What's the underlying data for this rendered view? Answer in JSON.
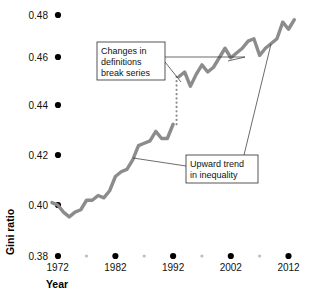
{
  "chart_data": {
    "type": "line",
    "title": "",
    "xlabel": "Year",
    "ylabel": "Gini ratio",
    "xlim": [
      1967,
      2014
    ],
    "ylim": [
      0.38,
      0.485
    ],
    "grid": false,
    "legend": "none",
    "y_ticks": [
      "0.48",
      "0.46",
      "0.44",
      "0.42",
      "0.40",
      "0.38"
    ],
    "y_tick_values": [
      0.48,
      0.46,
      0.44,
      0.42,
      0.4,
      0.38
    ],
    "x_ticks": [
      "1972",
      "1982",
      "1992",
      "2002",
      "2012"
    ],
    "x_tick_values": [
      1972,
      1982,
      1992,
      2002,
      2012
    ],
    "x_minor_tick_values": [
      1977,
      1987,
      1997,
      2007
    ],
    "line_color": "#8c8c8c",
    "series": [
      {
        "name": "Gini ratio (pre-1993 definitions)",
        "x": [
          1971,
          1972,
          1973,
          1974,
          1975,
          1976,
          1977,
          1978,
          1979,
          1980,
          1981,
          1982,
          1983,
          1984,
          1985,
          1986,
          1987,
          1988,
          1989,
          1990,
          1991,
          1992
        ],
        "values": [
          0.401,
          0.4,
          0.397,
          0.395,
          0.397,
          0.398,
          0.402,
          0.402,
          0.404,
          0.403,
          0.406,
          0.412,
          0.414,
          0.415,
          0.419,
          0.425,
          0.426,
          0.427,
          0.431,
          0.428,
          0.428,
          0.434
        ]
      },
      {
        "name": "Gini ratio (post-1993 definitions)",
        "x": [
          1993,
          1994,
          1995,
          1996,
          1997,
          1998,
          1999,
          2000,
          2001,
          2002,
          2003,
          2004,
          2005,
          2006,
          2007,
          2008,
          2009,
          2010,
          2011,
          2012,
          2013
        ],
        "values": [
          0.454,
          0.456,
          0.45,
          0.455,
          0.459,
          0.456,
          0.458,
          0.462,
          0.466,
          0.462,
          0.464,
          0.466,
          0.469,
          0.47,
          0.463,
          0.466,
          0.468,
          0.47,
          0.477,
          0.474,
          0.478
        ]
      }
    ],
    "break": {
      "style": "dotted",
      "x": 1992.6,
      "y_from": 0.434,
      "y_to": 0.454
    },
    "annotations": [
      {
        "id": "break-note",
        "lines": [
          "Changes in",
          "definitions",
          "break series"
        ],
        "box": {
          "x": 97,
          "y": 42,
          "width": 68,
          "height": 38
        }
      },
      {
        "id": "trend-note",
        "lines": [
          "Upward trend",
          "in inequality"
        ],
        "box": {
          "x": 186,
          "y": 155,
          "width": 72,
          "height": 28
        }
      }
    ]
  }
}
